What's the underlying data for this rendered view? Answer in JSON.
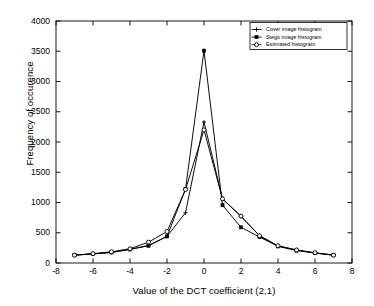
{
  "chart_data": {
    "type": "line",
    "title": "",
    "xlabel": "Value of the DCT coefficient (2,1)",
    "ylabel": "Frequency of occurence",
    "xlim": [
      -8,
      8
    ],
    "ylim": [
      0,
      4000
    ],
    "xticks": [
      -8,
      -6,
      -4,
      -2,
      0,
      2,
      4,
      6,
      8
    ],
    "yticks": [
      0,
      500,
      1000,
      1500,
      2000,
      2500,
      3000,
      3500,
      4000
    ],
    "xtick_labels": [
      "-8",
      "-6",
      "-4",
      "-2",
      "0",
      "2",
      "4",
      "6",
      "8"
    ],
    "ytick_labels": [
      "0",
      "500",
      "1000",
      "1500",
      "2000",
      "2500",
      "3000",
      "3500",
      "4000"
    ],
    "grid": false,
    "legend_position": "top-right",
    "x": [
      -7,
      -6,
      -5,
      -4,
      -3,
      -2,
      -1,
      0,
      1,
      2,
      3,
      4,
      5,
      6,
      7
    ],
    "series": [
      {
        "name": "Cover image histogram",
        "marker": "plus",
        "color": "#000000",
        "values": [
          130,
          150,
          175,
          225,
          290,
          440,
          830,
          2330,
          1060,
          770,
          450,
          280,
          215,
          165,
          130
        ]
      },
      {
        "name": "Stego image histogram",
        "marker": "filled-square",
        "color": "#000000",
        "values": [
          130,
          150,
          175,
          225,
          285,
          440,
          1220,
          3510,
          955,
          590,
          430,
          275,
          205,
          165,
          130
        ]
      },
      {
        "name": "Estimated histogram",
        "marker": "open-circle",
        "color": "#000000",
        "values": [
          130,
          155,
          185,
          235,
          345,
          520,
          1215,
          2200,
          1060,
          775,
          450,
          285,
          215,
          170,
          130
        ]
      }
    ]
  },
  "legend": {
    "items": [
      {
        "label": "Cover image histogram",
        "marker": "plus"
      },
      {
        "label": "Stego image histogram",
        "marker": "filled-square"
      },
      {
        "label": "Estimated histogram",
        "marker": "open-circle"
      }
    ]
  },
  "axis": {
    "ylabel": "Frequency of occurence",
    "xlabel": "Value of the DCT coefficient (2,1)"
  }
}
